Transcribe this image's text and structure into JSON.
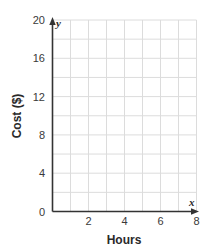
{
  "chart_data": {
    "type": "line",
    "title": "",
    "xlabel": "Hours",
    "ylabel": "Cost ($)",
    "x_axis_variable": "x",
    "y_axis_variable": "y",
    "xlim": [
      0,
      8
    ],
    "ylim": [
      0,
      20
    ],
    "x_ticks": [
      2,
      4,
      6,
      8
    ],
    "y_ticks": [
      0,
      4,
      8,
      12,
      16,
      20
    ],
    "x_grid_step": 1,
    "y_grid_step": 2,
    "grid": true,
    "series": [],
    "colors": {
      "axis": "#333333",
      "grid": "#dcdcdc",
      "text": "#3a3a3a"
    }
  }
}
